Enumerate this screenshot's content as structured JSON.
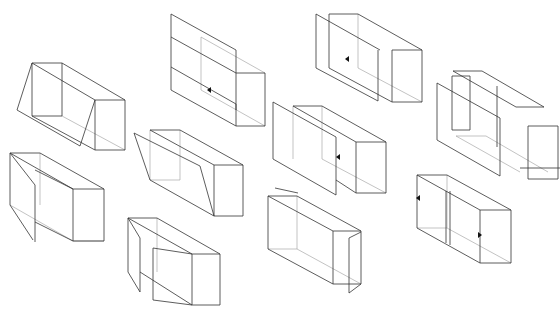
{
  "diagram": {
    "title": "",
    "background": "#ffffff",
    "stroke_color": "#333333",
    "boxes": [
      {
        "id": "box-1",
        "lines": [
          [
            32,
            63,
            62,
            63
          ],
          [
            62,
            63,
            125,
            100
          ],
          [
            32,
            63,
            95,
            100
          ],
          [
            95,
            100,
            125,
            100
          ],
          [
            95,
            100,
            95,
            150
          ],
          [
            125,
            100,
            125,
            150
          ],
          [
            95,
            150,
            125,
            150
          ],
          [
            32,
            116,
            95,
            150
          ],
          [
            32,
            63,
            17,
            110
          ],
          [
            17,
            110,
            80,
            146
          ],
          [
            80,
            146,
            95,
            100
          ],
          [
            62,
            63,
            62,
            116
          ],
          [
            32,
            63,
            32,
            116
          ],
          [
            32,
            116,
            62,
            116
          ]
        ],
        "light": [
          [
            62,
            116,
            125,
            150
          ]
        ],
        "arrows": []
      },
      {
        "id": "box-2",
        "lines": [
          [
            171,
            14,
            236,
            50
          ],
          [
            171,
            14,
            171,
            90
          ],
          [
            171,
            90,
            236,
            126
          ],
          [
            236,
            50,
            236,
            126
          ],
          [
            236,
            73,
            265,
            73
          ],
          [
            265,
            73,
            265,
            126
          ],
          [
            236,
            126,
            265,
            126
          ],
          [
            171,
            37,
            236,
            73
          ],
          [
            171,
            67,
            236,
            104
          ],
          [
            236,
            104,
            236,
            110
          ]
        ],
        "light": [
          [
            201,
            37,
            201,
            90
          ],
          [
            201,
            37,
            265,
            73
          ],
          [
            201,
            90,
            265,
            126
          ]
        ],
        "arrows": [
          [
            210,
            90,
            "left"
          ]
        ]
      },
      {
        "id": "box-3",
        "lines": [
          [
            316,
            14,
            380,
            50
          ],
          [
            316,
            14,
            316,
            68
          ],
          [
            316,
            68,
            378,
            101
          ],
          [
            378,
            50,
            378,
            101
          ],
          [
            329,
            14,
            358,
            14
          ],
          [
            358,
            14,
            422,
            50
          ],
          [
            329,
            14,
            329,
            68
          ],
          [
            392,
            50,
            422,
            50
          ],
          [
            392,
            50,
            392,
            102
          ],
          [
            422,
            50,
            422,
            102
          ],
          [
            392,
            102,
            422,
            102
          ],
          [
            329,
            68,
            392,
            102
          ]
        ],
        "light": [
          [
            358,
            14,
            358,
            68
          ],
          [
            358,
            68,
            422,
            102
          ]
        ],
        "arrows": [
          [
            348,
            59,
            "left"
          ]
        ]
      },
      {
        "id": "box-4",
        "lines": [
          [
            437,
            83,
            500,
            118
          ],
          [
            437,
            83,
            437,
            140
          ],
          [
            437,
            140,
            500,
            176
          ],
          [
            500,
            118,
            500,
            176
          ],
          [
            452,
            76,
            470,
            76
          ],
          [
            452,
            76,
            452,
            130
          ],
          [
            452,
            130,
            470,
            130
          ],
          [
            470,
            76,
            470,
            130
          ],
          [
            453,
            71,
            482,
            71
          ],
          [
            482,
            71,
            544,
            107
          ],
          [
            453,
            71,
            516,
            107
          ],
          [
            516,
            107,
            544,
            107
          ],
          [
            497,
            86,
            497,
            147
          ],
          [
            528,
            126,
            558,
            126
          ],
          [
            528,
            126,
            528,
            179
          ],
          [
            558,
            126,
            558,
            179
          ],
          [
            528,
            179,
            558,
            179
          ],
          [
            520,
            168,
            560,
            168
          ]
        ],
        "light": [
          [
            456,
            136,
            486,
            136
          ],
          [
            486,
            136,
            548,
            172
          ],
          [
            456,
            136,
            520,
            172
          ]
        ],
        "arrows": []
      },
      {
        "id": "box-5",
        "lines": [
          [
            10,
            153,
            40,
            153
          ],
          [
            40,
            153,
            104,
            189
          ],
          [
            10,
            153,
            73,
            189
          ],
          [
            73,
            189,
            104,
            189
          ],
          [
            73,
            189,
            73,
            241
          ],
          [
            104,
            189,
            104,
            241
          ],
          [
            73,
            241,
            104,
            241
          ],
          [
            35,
            222,
            73,
            241
          ],
          [
            35,
            170,
            73,
            189
          ],
          [
            10,
            153,
            10,
            205
          ],
          [
            10,
            153,
            35,
            185
          ],
          [
            35,
            185,
            35,
            242
          ],
          [
            10,
            205,
            33,
            240
          ]
        ],
        "light": [
          [
            10,
            205,
            73,
            241
          ],
          [
            40,
            153,
            40,
            205
          ],
          [
            73,
            241,
            104,
            241
          ]
        ],
        "arrows": []
      },
      {
        "id": "box-6",
        "lines": [
          [
            150,
            130,
            180,
            130
          ],
          [
            180,
            130,
            243,
            165
          ],
          [
            150,
            130,
            214,
            165
          ],
          [
            214,
            165,
            243,
            165
          ],
          [
            214,
            165,
            214,
            216
          ],
          [
            243,
            165,
            243,
            216
          ],
          [
            214,
            216,
            243,
            216
          ],
          [
            134,
            133,
            150,
            180
          ],
          [
            150,
            180,
            214,
            216
          ],
          [
            134,
            133,
            200,
            166
          ],
          [
            200,
            166,
            214,
            216
          ]
        ],
        "light": [
          [
            180,
            130,
            180,
            180
          ],
          [
            150,
            180,
            180,
            180
          ],
          [
            150,
            130,
            150,
            180
          ]
        ],
        "arrows": []
      },
      {
        "id": "box-7",
        "lines": [
          [
            128,
            218,
            157,
            218
          ],
          [
            157,
            218,
            220,
            254
          ],
          [
            128,
            218,
            192,
            254
          ],
          [
            192,
            254,
            220,
            254
          ],
          [
            192,
            254,
            192,
            305
          ],
          [
            220,
            254,
            220,
            305
          ],
          [
            192,
            305,
            220,
            305
          ],
          [
            128,
            218,
            128,
            272
          ],
          [
            128,
            218,
            140,
            238
          ],
          [
            140,
            238,
            140,
            292
          ],
          [
            128,
            272,
            140,
            292
          ],
          [
            153,
            248,
            153,
            300
          ],
          [
            153,
            248,
            192,
            254
          ],
          [
            153,
            300,
            192,
            305
          ],
          [
            140,
            272,
            192,
            305
          ]
        ],
        "light": [
          [
            157,
            218,
            157,
            272
          ]
        ],
        "arrows": []
      },
      {
        "id": "box-8",
        "lines": [
          [
            273,
            102,
            336,
            137
          ],
          [
            273,
            102,
            273,
            159
          ],
          [
            273,
            159,
            336,
            195
          ],
          [
            336,
            137,
            336,
            195
          ],
          [
            293,
            106,
            322,
            106
          ],
          [
            322,
            106,
            386,
            142
          ],
          [
            293,
            106,
            356,
            142
          ],
          [
            356,
            142,
            386,
            142
          ],
          [
            356,
            142,
            356,
            193
          ],
          [
            386,
            142,
            386,
            193
          ],
          [
            356,
            193,
            386,
            193
          ],
          [
            336,
            180,
            356,
            193
          ]
        ],
        "light": [
          [
            293,
            106,
            293,
            159
          ],
          [
            322,
            106,
            322,
            159
          ],
          [
            322,
            159,
            386,
            193
          ]
        ],
        "arrows": [
          [
            339,
            157,
            "left"
          ]
        ]
      },
      {
        "id": "box-9",
        "lines": [
          [
            268,
            196,
            297,
            196
          ],
          [
            297,
            196,
            361,
            231
          ],
          [
            268,
            196,
            333,
            231
          ],
          [
            333,
            231,
            361,
            231
          ],
          [
            333,
            231,
            333,
            284
          ],
          [
            361,
            231,
            361,
            284
          ],
          [
            333,
            284,
            361,
            284
          ],
          [
            268,
            196,
            268,
            249
          ],
          [
            268,
            249,
            333,
            284
          ],
          [
            275,
            188,
            298,
            193
          ],
          [
            349,
            238,
            361,
            232
          ],
          [
            349,
            238,
            349,
            293
          ],
          [
            349,
            293,
            361,
            284
          ]
        ],
        "light": [
          [
            268,
            249,
            297,
            249
          ],
          [
            297,
            196,
            297,
            249
          ],
          [
            297,
            249,
            361,
            284
          ]
        ],
        "arrows": []
      },
      {
        "id": "box-10",
        "lines": [
          [
            417,
            175,
            447,
            175
          ],
          [
            447,
            175,
            511,
            210
          ],
          [
            417,
            175,
            480,
            210
          ],
          [
            480,
            210,
            511,
            210
          ],
          [
            480,
            210,
            480,
            263
          ],
          [
            511,
            210,
            511,
            263
          ],
          [
            480,
            263,
            511,
            263
          ],
          [
            417,
            175,
            417,
            228
          ],
          [
            417,
            228,
            480,
            263
          ],
          [
            446,
            191,
            446,
            243
          ],
          [
            450,
            191,
            450,
            245
          ]
        ],
        "light": [
          [
            447,
            175,
            447,
            228
          ],
          [
            417,
            228,
            447,
            228
          ],
          [
            447,
            228,
            511,
            263
          ]
        ],
        "arrows": [
          [
            419,
            198,
            "left"
          ],
          [
            479,
            235,
            "right"
          ]
        ]
      }
    ]
  }
}
